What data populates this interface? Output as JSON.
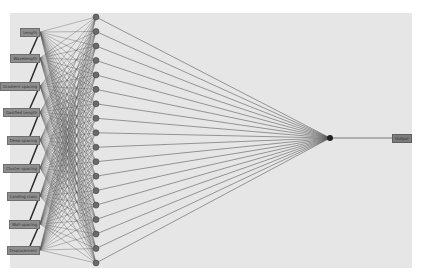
{
  "diagram": {
    "type": "neural-network",
    "background": "#e6e6e6",
    "edge_color": "#5a5a5a",
    "node_color": "#6a6a6a",
    "input_layer": {
      "x": 40,
      "labels": [
        "Length",
        "Wavelength",
        "Gradient spacing",
        "Gasified Length",
        "Deep spacing",
        "Cluster spacing",
        "Landing class",
        "Wall spacing",
        "Displacement"
      ],
      "y": [
        32,
        58,
        86,
        112,
        140,
        168,
        196,
        224,
        250
      ]
    },
    "hidden_layer": {
      "x": 96,
      "count": 18,
      "y_start": 17,
      "y_end": 263
    },
    "output_layer": {
      "node_x": 330,
      "node_y": 138,
      "label": "Output",
      "label_x": 392
    }
  }
}
